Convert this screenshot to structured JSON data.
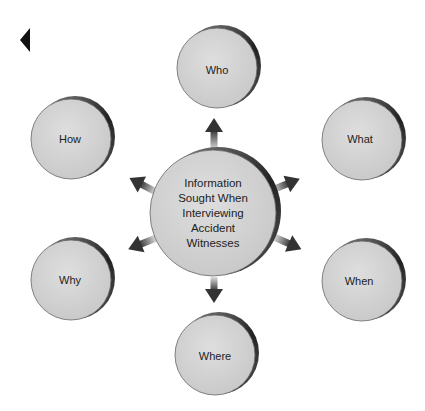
{
  "nav": {
    "back_icon": "triangle-left-icon"
  },
  "diagram": {
    "center": {
      "label": "Information Sought When Interviewing Accident Witnesses",
      "lines": [
        "Information",
        "Sought When",
        "Interviewing",
        "Accident",
        "Witnesses"
      ]
    },
    "nodes": [
      {
        "id": "who",
        "label": "Who"
      },
      {
        "id": "what",
        "label": "What"
      },
      {
        "id": "when",
        "label": "When"
      },
      {
        "id": "where",
        "label": "Where"
      },
      {
        "id": "why",
        "label": "Why"
      },
      {
        "id": "how",
        "label": "How"
      }
    ],
    "colors": {
      "circle_fill": "#d4d4d4",
      "rim": "#333333",
      "arrow": "#3a3a3a"
    }
  }
}
